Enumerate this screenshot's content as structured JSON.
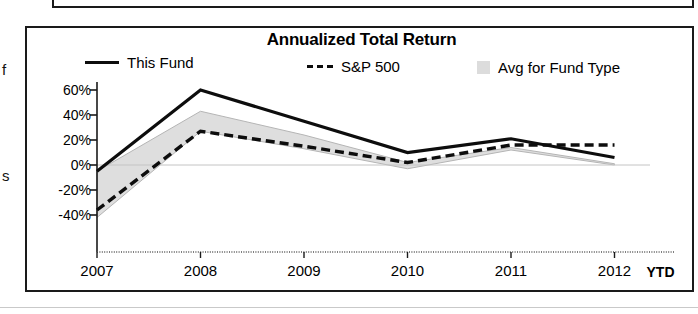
{
  "margin_text": {
    "char_top": "f",
    "char_bottom": "s"
  },
  "chart": {
    "title": "Annualized Total Return",
    "legend": [
      {
        "label": "This Fund",
        "style": "solid-line",
        "color": "#0d0d0d"
      },
      {
        "label": "S&P 500",
        "style": "dashed-line",
        "color": "#0d0d0d"
      },
      {
        "label": "Avg for Fund Type",
        "style": "filled-band",
        "color": "#dcdcdc"
      }
    ],
    "ytd_label": "YTD"
  },
  "chart_data": {
    "type": "line",
    "title": "Annualized Total Return",
    "xlabel": "",
    "ylabel": "",
    "categories": [
      "2007",
      "2008",
      "2009",
      "2010",
      "2011",
      "2012"
    ],
    "x_tick_labels": [
      "2007",
      "2008",
      "2009",
      "2010",
      "2011",
      "2012"
    ],
    "x_axis_note": "YTD",
    "y_tick_labels": [
      "60%",
      "40%",
      "20%",
      "0%",
      "-20%",
      "-40%"
    ],
    "y_tick_values": [
      60,
      40,
      20,
      0,
      -20,
      -40
    ],
    "ylim": [
      -50,
      70
    ],
    "grid": false,
    "legend_position": "top",
    "series": [
      {
        "name": "This Fund",
        "style": "solid",
        "values": [
          -5,
          60,
          35,
          10,
          21,
          6
        ]
      },
      {
        "name": "S&P 500",
        "style": "dashed",
        "values": [
          -36,
          27,
          15,
          2,
          16,
          16
        ]
      },
      {
        "name": "Avg for Fund Type",
        "style": "band",
        "upper": [
          -5,
          43,
          24,
          2,
          14,
          1
        ],
        "lower": [
          -42,
          27,
          13,
          -3,
          12,
          0
        ]
      }
    ]
  }
}
